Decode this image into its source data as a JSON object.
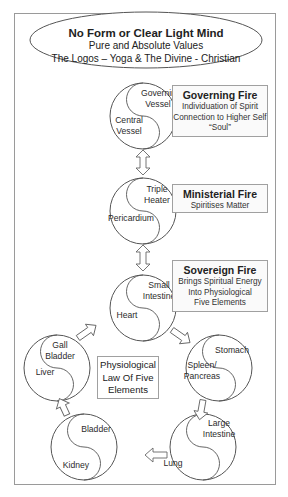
{
  "header": {
    "title": "No Form or Clear Light Mind",
    "line1": "Pure and Absolute Values",
    "line2": "The Logos – Yoga & The Divine - Christian"
  },
  "circles": [
    {
      "id": "governing",
      "upper": [
        "Governing",
        "Vessel"
      ],
      "lower": [
        "Central",
        "Vessel"
      ]
    },
    {
      "id": "triple",
      "upper": [
        "Triple",
        "Heater"
      ],
      "lower": [
        "Pericardium"
      ]
    },
    {
      "id": "heart",
      "upper": [
        "Small",
        "Intestine"
      ],
      "lower": [
        "Heart"
      ]
    },
    {
      "id": "stomach",
      "upper": [
        "Stomach"
      ],
      "lower": [
        "Spleen/",
        "Pancreas"
      ]
    },
    {
      "id": "lung",
      "upper": [
        "Large",
        "Intestine"
      ],
      "lower": [
        "Lung"
      ]
    },
    {
      "id": "kidney",
      "upper": [
        "Bladder"
      ],
      "lower": [
        "Kidney"
      ]
    },
    {
      "id": "liver",
      "upper": [
        "Gall",
        "Bladder"
      ],
      "lower": [
        "Liver"
      ]
    }
  ],
  "labels": {
    "governing_u1": "Governing",
    "governing_u2": "Vessel",
    "governing_l1": "Central",
    "governing_l2": "Vessel",
    "triple_u1": "Triple",
    "triple_u2": "Heater",
    "triple_l1": "Pericardium",
    "heart_u1": "Small",
    "heart_u2": "Intestine",
    "heart_l1": "Heart",
    "stomach_u1": "Stomach",
    "stomach_l1": "Spleen/",
    "stomach_l2": "Pancreas",
    "lung_u1": "Large",
    "lung_u2": "Intestine",
    "lung_l1": "Lung",
    "kidney_u1": "Bladder",
    "kidney_l1": "Kidney",
    "liver_u1": "Gall",
    "liver_u2": "Bladder",
    "liver_l1": "Liver"
  },
  "boxes": {
    "governing_fire": {
      "title": "Governing Fire",
      "lines": [
        "Individuation of Spirit",
        "Connection to Higher Self",
        "“Soul”"
      ]
    },
    "ministerial_fire": {
      "title": "Ministerial Fire",
      "lines": [
        "Spiritises Matter"
      ]
    },
    "sovereign_fire": {
      "title": "Sovereign Fire",
      "lines": [
        "Brings Spiritual Energy",
        "Into Physiological",
        "Five Elements"
      ]
    }
  },
  "center": {
    "lines": [
      "Physiological",
      "Law Of Five",
      "Elements"
    ]
  },
  "arrows": [
    {
      "from": "governing",
      "to": "triple",
      "type": "double-vertical"
    },
    {
      "from": "triple",
      "to": "heart",
      "type": "double-vertical"
    },
    {
      "from": "heart",
      "to": "stomach",
      "type": "single"
    },
    {
      "from": "stomach",
      "to": "lung",
      "type": "single"
    },
    {
      "from": "lung",
      "to": "kidney",
      "type": "single"
    },
    {
      "from": "kidney",
      "to": "liver",
      "type": "single"
    },
    {
      "from": "liver",
      "to": "heart",
      "type": "single"
    }
  ],
  "colors": {
    "stroke": "#555555",
    "frame": "#9a9a9a",
    "text": "#222222"
  }
}
